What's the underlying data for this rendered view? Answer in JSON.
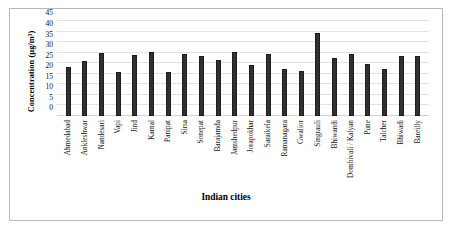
{
  "chart_data": {
    "type": "bar",
    "title": "",
    "xlabel": "Indian cities",
    "ylabel": "Concentration (µg/m³)",
    "ylim": [
      0,
      45
    ],
    "yticks": [
      0,
      5,
      10,
      15,
      20,
      25,
      30,
      35,
      40,
      45
    ],
    "grid": true,
    "legend": false,
    "bar_color": "#303030",
    "categories": [
      "Ahmedabad",
      "Ankleshwar",
      "Nandesari",
      "Vapi",
      "Jind",
      "Karnal",
      "Panipat",
      "Sirsa",
      "Sonepat",
      "Barajamda",
      "Jamshedpur",
      "Jorapokhar",
      "Saraikela",
      "Ramanagara",
      "Gwalior",
      "Singrauli",
      "Bhiwandi",
      "Dombivali / Kalyan",
      "Pune",
      "Talcher",
      "Bhiwadi",
      "Bareilly"
    ],
    "values": [
      23.0,
      26.0,
      30.0,
      21.0,
      29.0,
      30.2,
      21.0,
      29.2,
      28.3,
      26.3,
      30.4,
      24.3,
      29.4,
      22.3,
      21.4,
      39.5,
      27.5,
      29.6,
      24.6,
      22.5,
      28.6,
      28.6
    ]
  }
}
